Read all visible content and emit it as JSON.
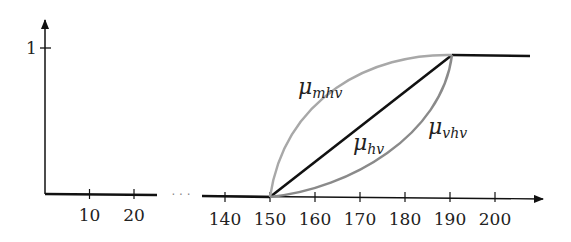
{
  "chart_data": {
    "type": "line",
    "title": "",
    "xlabel": "",
    "ylabel": "",
    "ylim": [
      0,
      1
    ],
    "y_ticks": [
      {
        "value": 1,
        "label": "1"
      }
    ],
    "x_axis_break": {
      "after": 25,
      "before": 135,
      "symbol": "· · ·"
    },
    "x_ticks_left": [
      {
        "value": 10,
        "label": "10"
      },
      {
        "value": 20,
        "label": "20"
      }
    ],
    "x_ticks_right": [
      {
        "value": 140,
        "label": "140"
      },
      {
        "value": 150,
        "label": "150"
      },
      {
        "value": 160,
        "label": "160"
      },
      {
        "value": 170,
        "label": "170"
      },
      {
        "value": 180,
        "label": "180"
      },
      {
        "value": 190,
        "label": "190"
      },
      {
        "value": 200,
        "label": "200"
      }
    ],
    "series": [
      {
        "name": "mu_hv",
        "label_base": "μ",
        "label_sub": "hv",
        "shape": "linear",
        "color": "#111111",
        "points": [
          [
            0,
            0
          ],
          [
            25,
            0
          ],
          [
            135,
            0
          ],
          [
            150,
            0
          ],
          [
            190,
            1
          ],
          [
            208,
            1
          ]
        ]
      },
      {
        "name": "mu_mhv",
        "label_base": "μ",
        "label_sub": "mhv",
        "shape": "concave",
        "color": "#a8a8a8",
        "points": [
          [
            150,
            0
          ],
          [
            190,
            1
          ]
        ]
      },
      {
        "name": "mu_vhv",
        "label_base": "μ",
        "label_sub": "vhv",
        "shape": "convex",
        "color": "#8a8a8a",
        "points": [
          [
            150,
            0
          ],
          [
            190,
            1
          ]
        ]
      }
    ],
    "grid": false,
    "legend": "none"
  }
}
